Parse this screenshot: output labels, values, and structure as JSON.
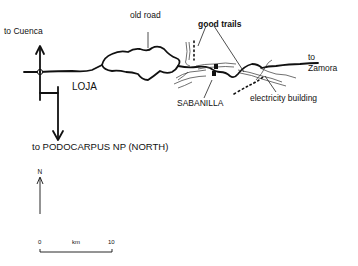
{
  "map": {
    "labels": {
      "to_cuenca": "to Cuenca",
      "old_road": "old road",
      "good_trails": "good trails",
      "loja": "LOJA",
      "sabanilla": "SABANILLA",
      "to": "to",
      "zamora": "Zamora",
      "electricity_building": "electricity building",
      "to_podocarpus": "to PODOCARPUS NP (NORTH)"
    },
    "north_arrow": {
      "label": "N"
    },
    "scale_bar": {
      "start": "0",
      "unit": "km",
      "end": "10"
    },
    "colors": {
      "ink": "#111111",
      "background": "#ffffff"
    }
  }
}
